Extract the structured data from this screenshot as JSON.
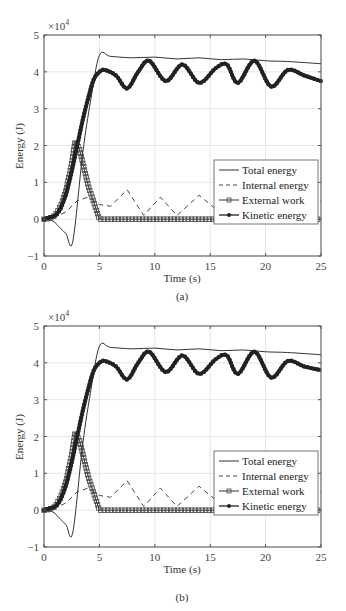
{
  "figures": [
    {
      "caption": "(a)"
    },
    {
      "caption": "(b)"
    }
  ],
  "axes": {
    "xlabel": "Time (s)",
    "ylabel": "Energy (J)",
    "exponent": "×10",
    "exponent_power": "4",
    "xticks": [
      "0",
      "5",
      "10",
      "15",
      "20",
      "25"
    ],
    "yticks": [
      "−1",
      "0",
      "1",
      "2",
      "3",
      "4",
      "5"
    ]
  },
  "legend": {
    "items": [
      "Total energy",
      "Internal energy",
      "External work",
      "Kinetic energy"
    ]
  },
  "chart_data": [
    {
      "type": "line",
      "title": "(a)",
      "xlabel": "Time (s)",
      "ylabel": "Energy (J)",
      "y_scale_factor": 10000,
      "xlim": [
        0,
        25
      ],
      "ylim": [
        -1,
        5
      ],
      "grid": true,
      "legend_position": "center-right",
      "series": [
        {
          "name": "Total energy",
          "style": "solid thin",
          "x": [
            0,
            0.8,
            1.5,
            2.0,
            2.6,
            3.5,
            4.2,
            5.0,
            6,
            8,
            10,
            12,
            14,
            16,
            18,
            20,
            22,
            25
          ],
          "y": [
            0,
            -0.05,
            -0.25,
            -0.4,
            -0.6,
            1.8,
            3.2,
            4.45,
            4.42,
            4.38,
            4.4,
            4.35,
            4.38,
            4.33,
            4.35,
            4.3,
            4.28,
            4.22
          ]
        },
        {
          "name": "Internal energy",
          "style": "dashed",
          "x": [
            0,
            1,
            2,
            3,
            4,
            5,
            6,
            7.5,
            9,
            10.5,
            12,
            14,
            15.8,
            17,
            18.3,
            19.5,
            21.5,
            23,
            25
          ],
          "y": [
            0,
            0.05,
            0.2,
            0.5,
            0.6,
            0.4,
            0.35,
            0.8,
            0.1,
            0.6,
            0.1,
            0.65,
            0.2,
            0.55,
            0.2,
            0.05,
            0.7,
            0.2,
            0.5
          ]
        },
        {
          "name": "External work",
          "style": "solid with square markers",
          "x": [
            0,
            0.5,
            1,
            1.5,
            2,
            2.5,
            2.8,
            3.2,
            3.6,
            4,
            4.5,
            5,
            10,
            15,
            20,
            25
          ],
          "y": [
            0,
            0.02,
            0.1,
            0.35,
            0.8,
            1.5,
            2.1,
            1.9,
            1.4,
            0.9,
            0.45,
            0,
            0,
            0,
            0,
            0
          ]
        },
        {
          "name": "Kinetic energy",
          "style": "solid thick with dot markers",
          "x": [
            0,
            1,
            1.5,
            2,
            2.5,
            3,
            3.5,
            4,
            4.5,
            5,
            5.5,
            6.5,
            7.5,
            8.5,
            9.5,
            11,
            12.5,
            14,
            15.5,
            16.5,
            17.5,
            19,
            20.5,
            22,
            23.5,
            25
          ],
          "y": [
            0,
            0.1,
            0.3,
            0.7,
            1.3,
            2.0,
            2.7,
            3.3,
            3.8,
            4.0,
            4.05,
            3.9,
            3.55,
            4.0,
            4.3,
            3.75,
            4.2,
            3.7,
            4.1,
            4.2,
            3.7,
            4.3,
            3.6,
            4.05,
            3.9,
            3.75
          ]
        }
      ]
    },
    {
      "type": "line",
      "title": "(b)",
      "xlabel": "Time (s)",
      "ylabel": "Energy (J)",
      "y_scale_factor": 10000,
      "xlim": [
        0,
        25
      ],
      "ylim": [
        -1,
        5
      ],
      "grid": true,
      "legend_position": "center-right",
      "series": [
        {
          "name": "Total energy",
          "style": "solid thin",
          "x": [
            0,
            0.8,
            1.5,
            2.0,
            2.6,
            3.5,
            4.2,
            5.0,
            6,
            8,
            10,
            12,
            14,
            16,
            18,
            20,
            22,
            25
          ],
          "y": [
            0,
            -0.05,
            -0.25,
            -0.4,
            -0.6,
            1.8,
            3.2,
            4.45,
            4.42,
            4.38,
            4.4,
            4.35,
            4.38,
            4.33,
            4.35,
            4.3,
            4.28,
            4.22
          ]
        },
        {
          "name": "Internal energy",
          "style": "dashed",
          "x": [
            0,
            1,
            2,
            3,
            4,
            5,
            6,
            7.5,
            9,
            10.5,
            12,
            14,
            15.8,
            17,
            18.3,
            19.5,
            21.5,
            23,
            25
          ],
          "y": [
            0,
            0.05,
            0.2,
            0.5,
            0.6,
            0.4,
            0.35,
            0.8,
            0.1,
            0.6,
            0.1,
            0.65,
            0.2,
            0.55,
            0.2,
            0.05,
            0.7,
            0.2,
            0.5
          ]
        },
        {
          "name": "External work",
          "style": "solid with square markers",
          "x": [
            0,
            0.5,
            1,
            1.5,
            2,
            2.5,
            2.8,
            3.2,
            3.6,
            4,
            4.5,
            5,
            10,
            15,
            20,
            25
          ],
          "y": [
            0,
            0.02,
            0.1,
            0.35,
            0.8,
            1.5,
            2.1,
            1.9,
            1.4,
            0.9,
            0.45,
            0,
            0,
            0,
            0,
            0
          ]
        },
        {
          "name": "Kinetic energy",
          "style": "solid thick with dot markers",
          "x": [
            0,
            1,
            1.5,
            2,
            2.5,
            3,
            3.5,
            4,
            4.5,
            5,
            5.5,
            6.5,
            7.5,
            8.5,
            9.5,
            11,
            12.5,
            14,
            15.5,
            16.5,
            17.5,
            19,
            20.5,
            22,
            23.5,
            25
          ],
          "y": [
            0,
            0.1,
            0.3,
            0.7,
            1.3,
            2.0,
            2.7,
            3.3,
            3.8,
            4.0,
            4.05,
            3.9,
            3.55,
            4.0,
            4.3,
            3.75,
            4.2,
            3.7,
            4.1,
            4.2,
            3.7,
            4.3,
            3.6,
            4.05,
            3.9,
            3.8
          ]
        }
      ]
    }
  ]
}
